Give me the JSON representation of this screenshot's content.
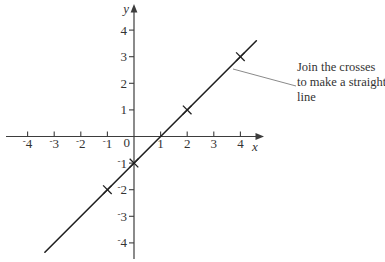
{
  "chart_data": {
    "type": "line",
    "xlabel": "x",
    "ylabel": "y",
    "xlim": [
      -4.9,
      4.9
    ],
    "ylim": [
      -4.9,
      4.9
    ],
    "grid": false,
    "x_ticks": [
      {
        "value": -4,
        "label": "⁻4"
      },
      {
        "value": -3,
        "label": "⁻3"
      },
      {
        "value": -2,
        "label": "⁻2"
      },
      {
        "value": -1,
        "label": "⁻1"
      },
      {
        "value": 1,
        "label": "1"
      },
      {
        "value": 2,
        "label": "2"
      },
      {
        "value": 3,
        "label": "3"
      },
      {
        "value": 4,
        "label": "4"
      }
    ],
    "y_ticks": [
      {
        "value": 4,
        "label": "4"
      },
      {
        "value": 3,
        "label": "3"
      },
      {
        "value": 2,
        "label": "2"
      },
      {
        "value": 1,
        "label": "1"
      },
      {
        "value": -1,
        "label": "⁻1"
      },
      {
        "value": -2,
        "label": "⁻2"
      },
      {
        "value": -3,
        "label": "⁻3"
      },
      {
        "value": -4,
        "label": "⁻4"
      }
    ],
    "origin_label": "0",
    "marker": "cross",
    "points": [
      {
        "x": -1,
        "y": -2
      },
      {
        "x": 0,
        "y": -1
      },
      {
        "x": 2,
        "y": 1
      },
      {
        "x": 4,
        "y": 3
      }
    ],
    "slope": 1,
    "intercept": -1,
    "line_segment": {
      "x1": -3.35,
      "y1": -4.35,
      "x2": 4.6,
      "y2": 3.6
    }
  },
  "annotation": {
    "lines": [
      "Join the crosses",
      "to make a straight",
      "line"
    ],
    "leader": {
      "from_px": [
        233,
        69
      ],
      "to_px": [
        296,
        86
      ]
    }
  },
  "colors": {
    "background": "#ffffff",
    "axis": "#3d3d3d",
    "plot_line": "#1f1f1f",
    "marker": "#1f1f1f",
    "text": "#333333",
    "leader": "#8a8a8a"
  }
}
